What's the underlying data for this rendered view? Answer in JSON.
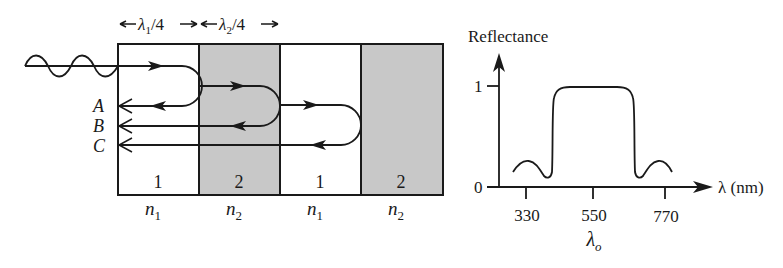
{
  "stack": {
    "spacing_labels": [
      {
        "symbol": "λ",
        "sub": "1",
        "suffix": "/4"
      },
      {
        "symbol": "λ",
        "sub": "2",
        "suffix": "/4"
      }
    ],
    "layers": [
      {
        "number": "1",
        "index_symbol": "n",
        "index_sub": "1",
        "fill": "#ffffff"
      },
      {
        "number": "2",
        "index_symbol": "n",
        "index_sub": "2",
        "fill": "#c8c8c8"
      },
      {
        "number": "1",
        "index_symbol": "n",
        "index_sub": "1",
        "fill": "#ffffff"
      },
      {
        "number": "2",
        "index_symbol": "n",
        "index_sub": "2",
        "fill": "#c8c8c8"
      }
    ],
    "reflected_rays": [
      "A",
      "B",
      "C"
    ],
    "colors": {
      "ink": "#1a1a1a",
      "high_index_fill": "#c8c8c8"
    }
  },
  "chart_data": {
    "type": "line",
    "title": "",
    "ylabel": "Reflectance",
    "xlabel": "λ (nm)",
    "x_ticks": [
      330,
      550,
      770
    ],
    "y_ticks": [
      0,
      1
    ],
    "center_label": "λo",
    "center_value": 550,
    "xlim": [
      250,
      900
    ],
    "ylim": [
      0,
      1.1
    ],
    "grid": false,
    "legend": null,
    "series": [
      {
        "name": "Reflectance",
        "x": [
          320,
          330,
          345,
          365,
          385,
          400,
          420,
          450,
          550,
          650,
          680,
          700,
          710,
          725,
          745,
          765,
          780
        ],
        "y": [
          0.16,
          0.25,
          0.26,
          0.1,
          0.1,
          0.9,
          0.97,
          0.99,
          0.99,
          0.99,
          0.97,
          0.9,
          0.1,
          0.1,
          0.26,
          0.25,
          0.16
        ]
      }
    ]
  }
}
